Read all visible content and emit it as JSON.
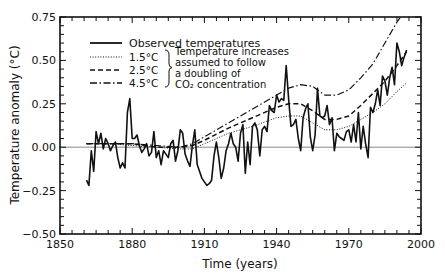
{
  "chart_data": {
    "type": "line",
    "title": "",
    "xlabel": "Time (years)",
    "ylabel": "Temperature anomaly (°C)",
    "xlim": [
      1850,
      2000
    ],
    "ylim": [
      -0.5,
      0.75
    ],
    "xticks": [
      1850,
      1880,
      1910,
      1940,
      1970,
      2000
    ],
    "xtick_labels": [
      "1850",
      "1880",
      "1910",
      "1940",
      "1970",
      "2000"
    ],
    "yticks": [
      -0.5,
      -0.25,
      0.0,
      0.25,
      0.5,
      0.75
    ],
    "ytick_labels": [
      "−0.50",
      "−0.25",
      "0.00",
      "0.25",
      "0.50",
      "0.75"
    ],
    "minor_xtick_step": 5,
    "minor_ytick_step": 0.05,
    "reference_line": 0.0,
    "grid": false,
    "legend": {
      "placement": "top-left",
      "entries": [
        {
          "label": "Observed temperatures",
          "style": "solid"
        },
        {
          "label": "1.5°C",
          "style": "dotted"
        },
        {
          "label": "2.5°C",
          "style": "dashed"
        },
        {
          "label": "4.5°C",
          "style": "dashdot"
        }
      ],
      "brace_note_lines": [
        "Temperature increases",
        "assumed to follow",
        "a doubling of",
        "CO₂ concentration"
      ]
    },
    "series": [
      {
        "name": "Observed temperatures",
        "style": "solid",
        "x": [
          1861,
          1862,
          1863,
          1864,
          1865,
          1866,
          1867,
          1868,
          1869,
          1870,
          1871,
          1872,
          1873,
          1874,
          1875,
          1876,
          1877,
          1878,
          1879,
          1880,
          1881,
          1882,
          1883,
          1884,
          1885,
          1886,
          1887,
          1888,
          1889,
          1890,
          1891,
          1892,
          1893,
          1894,
          1895,
          1896,
          1897,
          1898,
          1899,
          1900,
          1901,
          1902,
          1903,
          1904,
          1905,
          1906,
          1907,
          1908,
          1909,
          1910,
          1911,
          1912,
          1913,
          1914,
          1915,
          1916,
          1917,
          1918,
          1919,
          1920,
          1921,
          1922,
          1923,
          1924,
          1925,
          1926,
          1927,
          1928,
          1929,
          1930,
          1931,
          1932,
          1933,
          1934,
          1935,
          1936,
          1937,
          1938,
          1939,
          1940,
          1941,
          1942,
          1943,
          1944,
          1945,
          1946,
          1947,
          1948,
          1949,
          1950,
          1951,
          1952,
          1953,
          1954,
          1955,
          1956,
          1957,
          1958,
          1959,
          1960,
          1961,
          1962,
          1963,
          1964,
          1965,
          1966,
          1967,
          1968,
          1969,
          1970,
          1971,
          1972,
          1973,
          1974,
          1975,
          1976,
          1977,
          1978,
          1979,
          1980,
          1981,
          1982,
          1983,
          1984,
          1985,
          1986,
          1987,
          1988,
          1989,
          1990,
          1991,
          1992,
          1993,
          1994
        ],
        "y": [
          -0.19,
          -0.22,
          -0.02,
          -0.14,
          0.09,
          0.02,
          0.08,
          -0.01,
          0.05,
          0.02,
          -0.02,
          0.01,
          0.03,
          -0.06,
          -0.12,
          -0.09,
          -0.12,
          0.2,
          0.28,
          0.05,
          0.05,
          0.07,
          0.01,
          -0.03,
          -0.01,
          0.02,
          -0.05,
          -0.03,
          0.09,
          -0.06,
          -0.02,
          -0.1,
          -0.02,
          -0.04,
          -0.06,
          0.02,
          0.04,
          -0.08,
          -0.02,
          0.1,
          0.08,
          -0.04,
          -0.08,
          -0.11,
          0.01,
          0.1,
          -0.1,
          -0.14,
          -0.18,
          -0.2,
          -0.22,
          -0.21,
          -0.19,
          -0.05,
          0.03,
          -0.06,
          -0.18,
          -0.12,
          -0.02,
          0.02,
          0.08,
          0.02,
          0.0,
          -0.08,
          0.08,
          0.13,
          -0.15,
          0.03,
          -0.1,
          0.12,
          0.14,
          0.1,
          -0.05,
          0.1,
          0.12,
          0.09,
          0.24,
          0.21,
          0.2,
          0.3,
          0.26,
          0.28,
          0.27,
          0.47,
          0.28,
          0.12,
          0.13,
          0.16,
          0.05,
          -0.02,
          0.17,
          0.22,
          0.25,
          0.06,
          -0.02,
          0.07,
          0.34,
          0.18,
          0.17,
          0.18,
          0.24,
          0.13,
          0.17,
          -0.02,
          0.08,
          0.06,
          0.05,
          0.04,
          0.09,
          0.1,
          0.03,
          0.13,
          0.03,
          0.2,
          -0.01,
          0.12,
          0.02,
          -0.06,
          0.23,
          0.2,
          0.25,
          0.33,
          0.24,
          0.41,
          0.38,
          0.3,
          0.4,
          0.46,
          0.36,
          0.6,
          0.55,
          0.47,
          0.52,
          0.56
        ]
      },
      {
        "name": "1.5°C",
        "style": "dotted",
        "x": [
          1861,
          1870,
          1880,
          1890,
          1900,
          1905,
          1910,
          1920,
          1930,
          1940,
          1945,
          1950,
          1955,
          1960,
          1965,
          1970,
          1975,
          1980,
          1985,
          1990,
          1994
        ],
        "y": [
          0.02,
          0.02,
          0.01,
          0.0,
          -0.01,
          -0.01,
          0.02,
          0.08,
          0.12,
          0.17,
          0.18,
          0.18,
          0.14,
          0.1,
          0.1,
          0.12,
          0.16,
          0.2,
          0.25,
          0.32,
          0.37
        ]
      },
      {
        "name": "2.5°C",
        "style": "dashed",
        "x": [
          1861,
          1870,
          1880,
          1890,
          1900,
          1905,
          1910,
          1920,
          1930,
          1940,
          1945,
          1950,
          1955,
          1960,
          1965,
          1970,
          1975,
          1980,
          1985,
          1990,
          1994
        ],
        "y": [
          0.02,
          0.02,
          0.02,
          0.0,
          0.0,
          0.01,
          0.04,
          0.11,
          0.17,
          0.23,
          0.25,
          0.25,
          0.21,
          0.16,
          0.16,
          0.18,
          0.24,
          0.31,
          0.38,
          0.47,
          0.55
        ]
      },
      {
        "name": "4.5°C",
        "style": "dashdot",
        "x": [
          1861,
          1870,
          1880,
          1890,
          1900,
          1905,
          1910,
          1920,
          1930,
          1940,
          1945,
          1950,
          1955,
          1960,
          1965,
          1970,
          1975,
          1980,
          1985,
          1990,
          1994
        ],
        "y": [
          0.02,
          0.02,
          0.02,
          0.01,
          0.0,
          0.02,
          0.06,
          0.14,
          0.22,
          0.3,
          0.34,
          0.36,
          0.35,
          0.3,
          0.3,
          0.33,
          0.4,
          0.48,
          0.6,
          0.72,
          0.8
        ]
      }
    ]
  }
}
